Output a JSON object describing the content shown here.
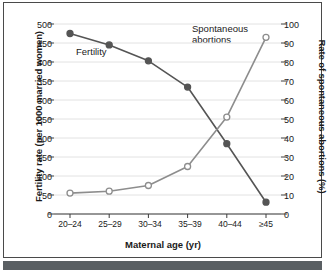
{
  "chart_data": {
    "type": "line",
    "title": "",
    "xlabel": "Maternal age (yr)",
    "categories": [
      "20–24",
      "25–29",
      "30–34",
      "35–39",
      "40–44",
      "≥45"
    ],
    "grid": true,
    "legend_position": "inline-annotations",
    "axes": {
      "left": {
        "label": "Fertility rate (per 1000 married women)",
        "ticks": [
          0,
          50,
          100,
          150,
          200,
          250,
          300,
          350,
          400,
          450,
          500
        ],
        "ylim": [
          0,
          500
        ]
      },
      "right": {
        "label": "Rate of spontaneous abortions (%)",
        "ticks": [
          0,
          10,
          20,
          30,
          40,
          50,
          60,
          70,
          80,
          90,
          100
        ],
        "ylim": [
          0,
          100
        ]
      }
    },
    "series": [
      {
        "name": "Fertility",
        "axis": "left",
        "marker": "filled-circle",
        "color": "#555555",
        "values": [
          475,
          445,
          403,
          334,
          185,
          31
        ]
      },
      {
        "name": "Spontaneous\nabortions",
        "axis": "right",
        "marker": "open-circle",
        "color": "#8d8d8d",
        "values": [
          11,
          12,
          15,
          25,
          51,
          93
        ]
      }
    ]
  },
  "annotations": {
    "fertility_label": "Fertility",
    "abortions_label": "Spontaneous\nabortions"
  },
  "colors": {
    "fertility_line": "#555555",
    "abortions_line": "#8d8d8d",
    "grid": "#e2e2e2",
    "axis": "#3c3c3c",
    "frame": "#4a4a4a",
    "footer_bar": "#5a5f63"
  }
}
